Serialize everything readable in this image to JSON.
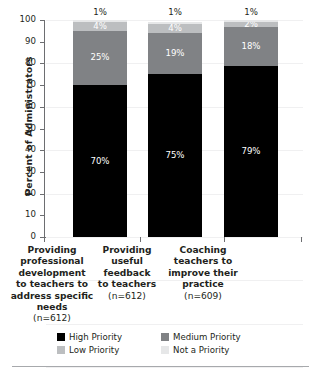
{
  "chart_data": {
    "type": "bar",
    "subtype": "stacked-bar-100",
    "title": "",
    "xlabel": "",
    "ylabel": "Percent of Administrators",
    "ylim": [
      0,
      100
    ],
    "ytick_labels": [
      "100",
      "90",
      "80",
      "70",
      "60",
      "50",
      "40",
      "30",
      "20",
      "10",
      "0"
    ],
    "ytick_values": [
      100,
      90,
      80,
      70,
      60,
      50,
      40,
      30,
      20,
      10,
      0
    ],
    "grid": true,
    "legend_position": "bottom",
    "categories": [
      "Providing professional development to teachers to address specific needs",
      "Providing useful feedback to teachers",
      "Coaching teachers to improve their practice"
    ],
    "category_lines": [
      [
        "Providing",
        "professional",
        "development",
        "to teachers to",
        "address specific",
        "needs",
        "(n=612)"
      ],
      [
        "Providing",
        "useful",
        "feedback",
        "to teachers",
        "(n=612)"
      ],
      [
        "Coaching",
        "teachers to",
        "improve their",
        "practice",
        "(n=609)"
      ]
    ],
    "sample_sizes": [
      "(n=612)",
      "(n=612)",
      "(n=609)"
    ],
    "series": [
      {
        "name": "High Priority",
        "color": "#000000",
        "values": [
          70,
          75,
          79
        ],
        "labels": [
          "70%",
          "75%",
          "79%"
        ]
      },
      {
        "name": "Medium Priority",
        "color": "#808285",
        "values": [
          25,
          19,
          18
        ],
        "labels": [
          "25%",
          "19%",
          "18%"
        ]
      },
      {
        "name": "Low Priority",
        "color": "#bcbec0",
        "values": [
          4,
          4,
          2
        ],
        "labels": [
          "4%",
          "4%",
          "2%"
        ]
      },
      {
        "name": "Not a Priority",
        "color": "#e6e7e8",
        "values": [
          1,
          1,
          1
        ],
        "labels": [
          "1%",
          "1%",
          "1%"
        ]
      }
    ]
  },
  "legend": {
    "items": [
      {
        "label": "High Priority",
        "color": "#000000"
      },
      {
        "label": "Medium Priority",
        "color": "#808285"
      },
      {
        "label": "Low Priority",
        "color": "#bcbec0"
      },
      {
        "label": "Not a Priority",
        "color": "#e6e7e8"
      }
    ]
  }
}
